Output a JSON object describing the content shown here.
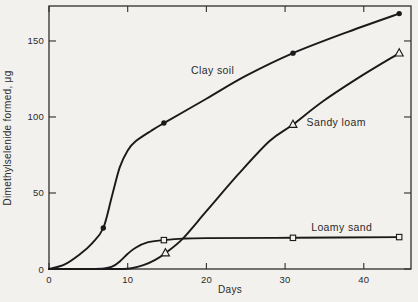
{
  "page": {
    "background_color": "#f2f1ee",
    "ink_color": "#1a1a1a"
  },
  "chart_data": {
    "type": "line",
    "title": "",
    "xlabel": "Days",
    "ylabel": "Dimethylselenide formed, μg",
    "xlim": [
      0,
      46
    ],
    "ylim": [
      0,
      173
    ],
    "x_ticks": [
      0,
      10,
      20,
      30,
      40
    ],
    "y_ticks": [
      0,
      50,
      100,
      150
    ],
    "grid": false,
    "mirror_ticks": true,
    "legend": "inline-labels",
    "series": [
      {
        "name": "Clay soil",
        "marker": "circle-filled",
        "curve": [
          [
            0,
            0
          ],
          [
            2,
            3
          ],
          [
            4,
            10
          ],
          [
            5.5,
            17
          ],
          [
            6.9,
            27
          ],
          [
            8,
            48
          ],
          [
            9,
            67
          ],
          [
            10,
            78
          ],
          [
            11,
            84
          ],
          [
            13,
            91
          ],
          [
            14.6,
            96
          ],
          [
            20,
            112
          ],
          [
            25,
            127
          ],
          [
            31,
            142
          ],
          [
            38,
            156
          ],
          [
            44.5,
            168
          ]
        ],
        "marker_points": [
          [
            6.9,
            27
          ],
          [
            14.6,
            96
          ],
          [
            31,
            142
          ],
          [
            44.5,
            168
          ]
        ],
        "label": {
          "text": "Clay soil",
          "x": 20.8,
          "y": 130.5
        }
      },
      {
        "name": "Sandy loam",
        "marker": "triangle-open",
        "curve": [
          [
            0,
            0
          ],
          [
            6,
            0
          ],
          [
            9,
            0
          ],
          [
            10.5,
            0.5
          ],
          [
            12,
            2.5
          ],
          [
            13.5,
            6
          ],
          [
            14.8,
            10.5
          ],
          [
            17,
            20
          ],
          [
            20,
            38
          ],
          [
            24,
            62
          ],
          [
            28,
            84
          ],
          [
            31,
            95
          ],
          [
            35,
            111
          ],
          [
            40,
            128
          ],
          [
            44.5,
            142
          ]
        ],
        "marker_points": [
          [
            14.8,
            10.5
          ],
          [
            31,
            95
          ],
          [
            44.5,
            142
          ]
        ],
        "label": {
          "text": "Sandy loam",
          "x": 36.5,
          "y": 96.5
        }
      },
      {
        "name": "Loamy sand",
        "marker": "square-open",
        "curve": [
          [
            0,
            0
          ],
          [
            5,
            0
          ],
          [
            7,
            0.3
          ],
          [
            8,
            1.5
          ],
          [
            9,
            5
          ],
          [
            10,
            10
          ],
          [
            11,
            14
          ],
          [
            12.5,
            17.5
          ],
          [
            14.6,
            19
          ],
          [
            17,
            20
          ],
          [
            20,
            20.3
          ],
          [
            31,
            20.5
          ],
          [
            44.5,
            21
          ]
        ],
        "marker_points": [
          [
            14.6,
            19
          ],
          [
            31,
            20.5
          ],
          [
            44.5,
            21
          ]
        ],
        "label": {
          "text": "Loamy sand",
          "x": 37.2,
          "y": 27
        }
      }
    ]
  }
}
